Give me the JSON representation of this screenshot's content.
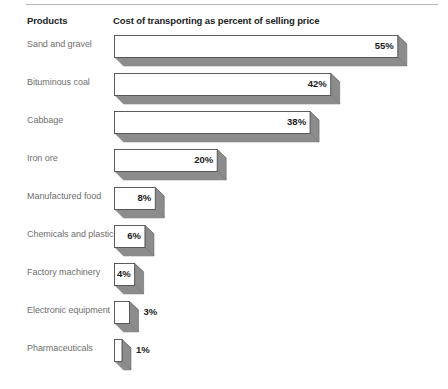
{
  "header": {
    "products_label": "Products",
    "title": "Cost of transporting as percent of selling price"
  },
  "chart_data": {
    "type": "bar",
    "orientation": "horizontal",
    "title": "Cost of transporting as percent of selling price",
    "xlabel": "",
    "ylabel": "Products",
    "xlim": [
      0,
      55
    ],
    "grid": false,
    "legend": "none",
    "value_suffix": "%",
    "categories": [
      "Sand and gravel",
      "Bituminous coal",
      "Cabbage",
      "Iron ore",
      "Manufactured food",
      "Chemicals and plastics",
      "Factory machinery",
      "Electronic equipment",
      "Pharmaceuticals"
    ],
    "values": [
      55,
      42,
      38,
      20,
      8,
      6,
      4,
      3,
      1
    ],
    "value_labels": [
      "55%",
      "42%",
      "38%",
      "20%",
      "8%",
      "6%",
      "4%",
      "3%",
      "1%"
    ],
    "label_placement": [
      "inside",
      "inside",
      "inside",
      "inside",
      "inside",
      "inside",
      "inside",
      "outside",
      "outside"
    ],
    "colors": {
      "bar_face": "#ffffff",
      "bar_face_edge": "#4d4d4d",
      "bar_side": "#8c8c8c",
      "bar_bottom": "#8c8c8c",
      "label_text": "#6f6f6f",
      "value_text": "#1b1b1b",
      "header_text": "#222222",
      "rule": "#b9b9b9",
      "background": "#ffffff"
    }
  }
}
